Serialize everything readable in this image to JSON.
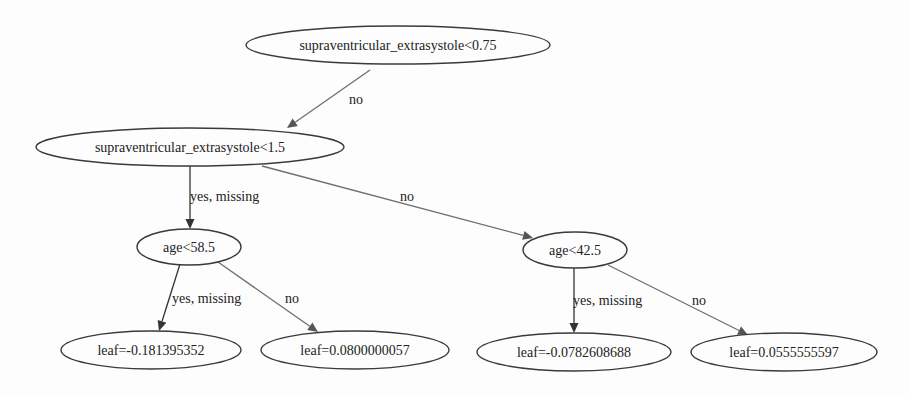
{
  "tree": {
    "nodes": [
      {
        "id": "n0",
        "label": "supraventricular_extrasystole<0.75",
        "type": "split",
        "cx": 398,
        "cy": 45,
        "rx": 152,
        "ry": 19
      },
      {
        "id": "n1",
        "label": "supraventricular_extrasystole<1.5",
        "type": "split",
        "cx": 190,
        "cy": 147,
        "rx": 154,
        "ry": 19
      },
      {
        "id": "n2",
        "label": "age<58.5",
        "type": "split",
        "cx": 189,
        "cy": 247,
        "rx": 52,
        "ry": 18
      },
      {
        "id": "n3",
        "label": "age<42.5",
        "type": "split",
        "cx": 575,
        "cy": 250,
        "rx": 52,
        "ry": 18
      },
      {
        "id": "n4",
        "label": "leaf=-0.181395352",
        "type": "leaf",
        "cx": 151,
        "cy": 350,
        "rx": 90,
        "ry": 19
      },
      {
        "id": "n5",
        "label": "leaf=0.0800000057",
        "type": "leaf",
        "cx": 355,
        "cy": 350,
        "rx": 94,
        "ry": 19
      },
      {
        "id": "n6",
        "label": "leaf=-0.0782608688",
        "type": "leaf",
        "cx": 574,
        "cy": 352,
        "rx": 97,
        "ry": 19
      },
      {
        "id": "n7",
        "label": "leaf=0.0555555597",
        "type": "leaf",
        "cx": 784,
        "cy": 352,
        "rx": 93,
        "ry": 19
      }
    ],
    "edges": [
      {
        "from": "n0",
        "to": "n1",
        "label": "no",
        "x1": 370,
        "y1": 70,
        "x2": 287,
        "y2": 128,
        "lx": 349,
        "ly": 104,
        "dark": false
      },
      {
        "from": "n1",
        "to": "n2",
        "label": "yes, missing",
        "x1": 190,
        "y1": 166,
        "x2": 190,
        "y2": 229,
        "lx": 190,
        "ly": 201,
        "dark": true
      },
      {
        "from": "n1",
        "to": "n3",
        "label": "no",
        "x1": 262,
        "y1": 166,
        "x2": 533,
        "y2": 238,
        "lx": 400,
        "ly": 201,
        "dark": false
      },
      {
        "from": "n2",
        "to": "n4",
        "label": "yes, missing",
        "x1": 180,
        "y1": 264,
        "x2": 159,
        "y2": 331,
        "lx": 172,
        "ly": 303,
        "dark": true
      },
      {
        "from": "n2",
        "to": "n5",
        "label": "no",
        "x1": 218,
        "y1": 262,
        "x2": 318,
        "y2": 332,
        "lx": 285,
        "ly": 303,
        "dark": false
      },
      {
        "from": "n3",
        "to": "n6",
        "label": "yes, missing",
        "x1": 574,
        "y1": 268,
        "x2": 574,
        "y2": 333,
        "lx": 573,
        "ly": 305,
        "dark": true
      },
      {
        "from": "n3",
        "to": "n7",
        "label": "no",
        "x1": 608,
        "y1": 265,
        "x2": 748,
        "y2": 335,
        "lx": 692,
        "ly": 305,
        "dark": false
      }
    ]
  }
}
